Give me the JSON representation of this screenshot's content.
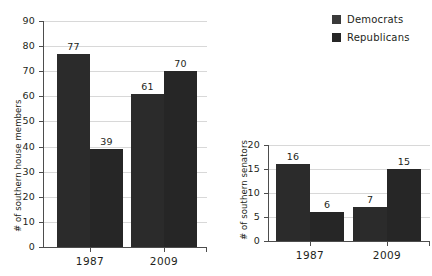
{
  "legend": {
    "items": [
      {
        "label": "Democrats",
        "color": "#3a3a3a",
        "key": "dem"
      },
      {
        "label": "Republicans",
        "color": "#262626",
        "key": "rep"
      }
    ]
  },
  "chart_data": [
    {
      "type": "bar",
      "id": "house",
      "title": "",
      "xlabel": "",
      "ylabel": "# of southern house members",
      "categories": [
        "1987",
        "2009"
      ],
      "ylim": [
        0,
        90
      ],
      "yticks": [
        0,
        10,
        20,
        30,
        40,
        50,
        60,
        70,
        80,
        90
      ],
      "ytick_labels": [
        "0",
        "10",
        "20",
        "30",
        "40",
        "50",
        "60",
        "70",
        "80",
        "90"
      ],
      "grid": true,
      "legend_position": "top-right",
      "series": [
        {
          "name": "Democrats",
          "values": [
            77,
            61
          ]
        },
        {
          "name": "Republicans",
          "values": [
            39,
            70
          ]
        }
      ],
      "data_labels": [
        "77",
        "39",
        "61",
        "70"
      ]
    },
    {
      "type": "bar",
      "id": "senate",
      "title": "",
      "xlabel": "",
      "ylabel": "# of southern senators",
      "categories": [
        "1987",
        "2009"
      ],
      "ylim": [
        0,
        20
      ],
      "yticks": [
        0,
        5,
        10,
        15,
        20
      ],
      "ytick_labels": [
        "0",
        "5",
        "10",
        "15",
        "20"
      ],
      "grid": true,
      "legend_position": "shared",
      "series": [
        {
          "name": "Democrats",
          "values": [
            16,
            7
          ]
        },
        {
          "name": "Republicans",
          "values": [
            6,
            15
          ]
        }
      ],
      "data_labels": [
        "16",
        "6",
        "7",
        "15"
      ]
    }
  ]
}
